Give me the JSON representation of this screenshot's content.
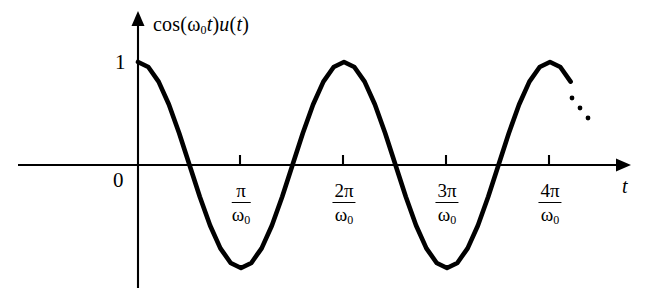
{
  "figure": {
    "background_color": "#ffffff",
    "curve_color": "#000000",
    "axis_color": "#000000",
    "function_label": {
      "prefix": "cos(",
      "omega": "ω",
      "omega_sub": "0",
      "var_t": "t",
      "mid": ")",
      "u": "u",
      "open": "(",
      "var_t2": "t",
      "close": ")"
    },
    "amplitude_label": "1",
    "origin_label": "0",
    "x_axis_label": "t",
    "omega_symbol": "ω",
    "omega_subscript": "0",
    "ellipsis": "…"
  },
  "chart_data": {
    "type": "line",
    "xlabel": "t",
    "ylabel": "",
    "grid": false,
    "legend": null,
    "function": "cos(omega_0 * t) * u(t)",
    "amplitude": 1,
    "period_label": "2π/ω₀",
    "xlim": [
      0,
      4.7
    ],
    "ylim": [
      -1,
      1
    ],
    "x_unit": "π/ω₀",
    "y_ticks": [
      {
        "value": 1,
        "label": "1"
      },
      {
        "value": 0,
        "label": "0"
      }
    ],
    "x_ticks": [
      {
        "value": 1,
        "numerator": "π",
        "denominator_base": "ω",
        "denominator_sub": "0",
        "label": "π/ω₀"
      },
      {
        "value": 2,
        "numerator": "2π",
        "denominator_base": "ω",
        "denominator_sub": "0",
        "label": "2π/ω₀"
      },
      {
        "value": 3,
        "numerator": "3π",
        "denominator_base": "ω",
        "denominator_sub": "0",
        "label": "3π/ω₀"
      },
      {
        "value": 4,
        "numerator": "4π",
        "denominator_base": "ω",
        "denominator_sub": "0",
        "label": "4π/ω₀"
      }
    ],
    "zero_crossings": [
      0.5,
      1.5,
      2.5,
      3.5
    ],
    "maxima": [
      {
        "x": 0,
        "y": 1
      },
      {
        "x": 2,
        "y": 1
      },
      {
        "x": 4,
        "y": 1
      }
    ],
    "minima": [
      {
        "x": 1,
        "y": -1
      },
      {
        "x": 3,
        "y": -1
      }
    ],
    "continuation": "dotted ellipsis after t = 4π/ω₀ indicating the waveform continues",
    "series": [
      {
        "name": "cos(ω₀t)u(t)",
        "x": [
          0,
          0.1,
          0.2,
          0.3,
          0.4,
          0.5,
          0.6,
          0.7,
          0.8,
          0.9,
          1.0,
          1.1,
          1.2,
          1.3,
          1.4,
          1.5,
          1.6,
          1.7,
          1.8,
          1.9,
          2.0,
          2.1,
          2.2,
          2.3,
          2.4,
          2.5,
          2.6,
          2.7,
          2.8,
          2.9,
          3.0,
          3.1,
          3.2,
          3.3,
          3.4,
          3.5,
          3.6,
          3.7,
          3.8,
          3.9,
          4.0,
          4.1,
          4.2
        ],
        "values": [
          1.0,
          0.951,
          0.809,
          0.588,
          0.309,
          0.0,
          -0.309,
          -0.588,
          -0.809,
          -0.951,
          -1.0,
          -0.951,
          -0.809,
          -0.588,
          -0.309,
          0.0,
          0.309,
          0.588,
          0.809,
          0.951,
          1.0,
          0.951,
          0.809,
          0.588,
          0.309,
          0.0,
          -0.309,
          -0.588,
          -0.809,
          -0.951,
          -1.0,
          -0.951,
          -0.809,
          -0.588,
          -0.309,
          0.0,
          0.309,
          0.588,
          0.809,
          0.951,
          1.0,
          0.951,
          0.809
        ]
      }
    ]
  }
}
